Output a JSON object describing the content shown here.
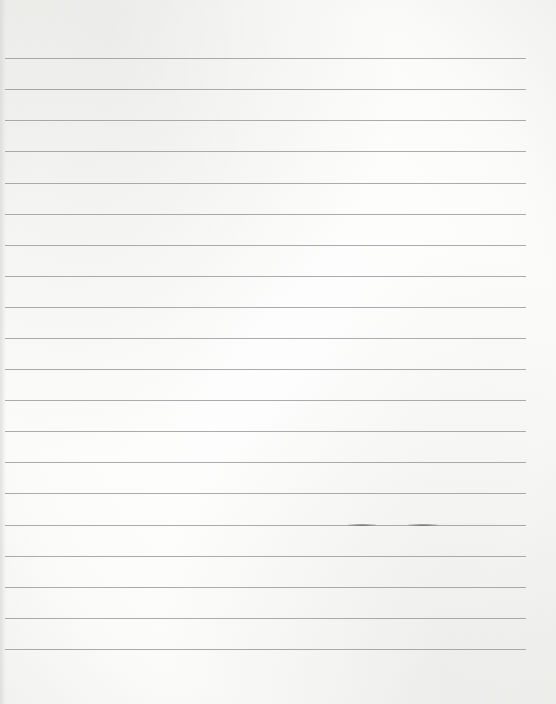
{
  "page": {
    "type": "ruled-notebook-paper",
    "background_color": "#fbfbfa",
    "line_color": "#9c9c9c",
    "line_left": 5,
    "line_right": 526,
    "lines_y": [
      58,
      89,
      120,
      151,
      183,
      214,
      245,
      276,
      307,
      338,
      369,
      400,
      431,
      462,
      493,
      525,
      556,
      587,
      618,
      649
    ],
    "smudges": [
      {
        "x": 348,
        "y": 524,
        "width": 28
      },
      {
        "x": 408,
        "y": 524,
        "width": 30
      }
    ],
    "text": ""
  }
}
